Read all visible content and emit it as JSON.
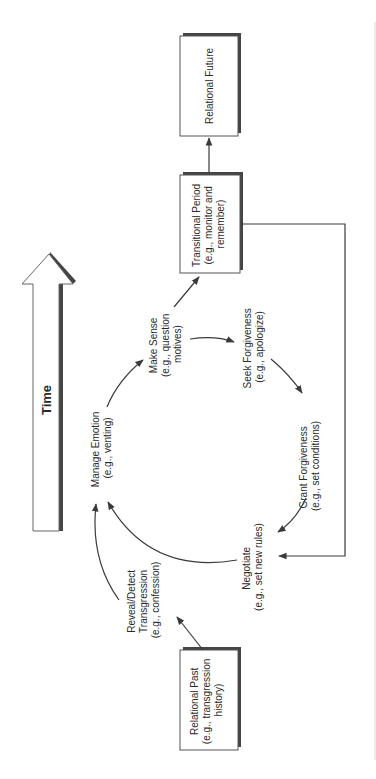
{
  "diagram": {
    "orientation": "rotated-90-ccw",
    "time_arrow": {
      "label": "Time"
    },
    "boxes": {
      "relational_past": {
        "lines": [
          "Relational Past",
          "(e.g., transgression",
          "history)"
        ]
      },
      "transitional_period": {
        "lines": [
          "Transitional Period",
          "(e.g., monitor and",
          "remember)"
        ]
      },
      "relational_future": {
        "lines": [
          "Relational Future"
        ]
      }
    },
    "cycle_nodes": {
      "reveal_detect": {
        "lines": [
          "Reveal/Detect",
          "Transgression",
          "(e.g., confession)"
        ]
      },
      "manage_emotion": {
        "lines": [
          "Manage Emotion",
          "(e.g., venting)"
        ]
      },
      "make_sense": {
        "lines": [
          "Make Sense",
          "(e.g., question",
          "motives)"
        ]
      },
      "seek_forgiveness": {
        "lines": [
          "Seek Forgiveness",
          "(e.g., apologize)"
        ]
      },
      "grant_forgiveness": {
        "lines": [
          "Grant Forgiveness",
          "(e.g., set conditions)"
        ]
      },
      "negotiate": {
        "lines": [
          "Negotiate",
          "(e.g., set new rules)"
        ]
      }
    },
    "colors": {
      "line": "#3a3a3a",
      "box_border": "#555555",
      "shadow": "#444444",
      "text": "#2a2a2a",
      "background": "#ffffff",
      "page_edge": "#d8d8d8"
    }
  }
}
